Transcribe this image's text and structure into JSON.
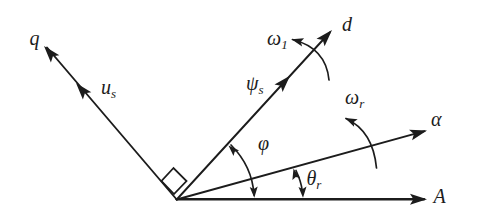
{
  "diagram": {
    "background": "#ffffff",
    "ink": "#1c1c1c",
    "labels": {
      "q": {
        "main": "q",
        "sub": ""
      },
      "u_s": {
        "main": "u",
        "sub": "s"
      },
      "d": {
        "main": "d",
        "sub": ""
      },
      "psi_s": {
        "main": "ψ",
        "sub": "s"
      },
      "omega_1": {
        "main": "ω",
        "sub": "1"
      },
      "omega_r": {
        "main": "ω",
        "sub": "r"
      },
      "phi": {
        "main": "φ",
        "sub": ""
      },
      "theta_r": {
        "main": "θ",
        "sub": "r"
      },
      "alpha": {
        "main": "α",
        "sub": ""
      },
      "A": {
        "main": "A",
        "sub": ""
      }
    }
  }
}
